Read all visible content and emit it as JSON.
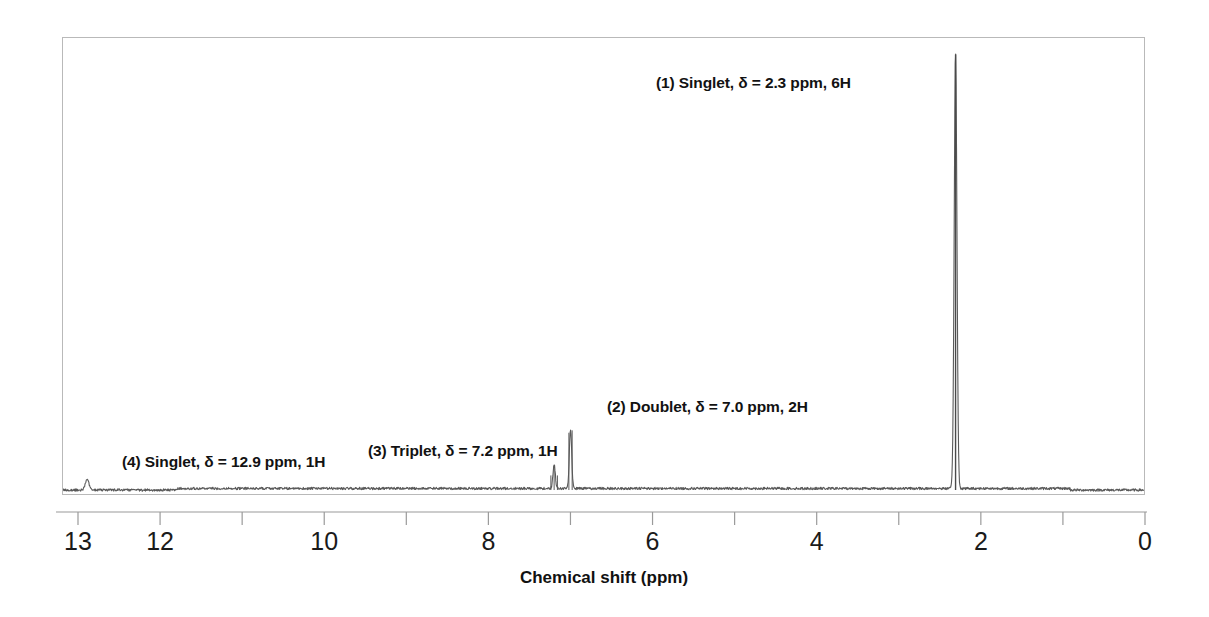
{
  "figure": {
    "title": "",
    "background_color": "#ffffff",
    "frame_color": "#b9b9b9",
    "trace_color": "#5a5a5a"
  },
  "axis": {
    "label": "Chemical shift (ppm)",
    "min_ppm": 0,
    "max_ppm": 13,
    "direction": "right-to-left",
    "tick_labels": [
      "13",
      "12",
      "10",
      "8",
      "6",
      "4",
      "2",
      "0"
    ],
    "tick_values": [
      13,
      12,
      10,
      8,
      6,
      4,
      2,
      0
    ],
    "minor_tick_values": [
      11,
      9,
      7,
      5,
      3,
      1
    ]
  },
  "annotations": [
    {
      "id": 1,
      "text": "(1) Singlet, δ = 2.3 ppm, 6H",
      "x_px": 656,
      "y_px": 74
    },
    {
      "id": 2,
      "text": "(2) Doublet, δ = 7.0 ppm, 2H",
      "x_px": 607,
      "y_px": 398
    },
    {
      "id": 3,
      "text": "(3) Triplet, δ = 7.2 ppm, 1H",
      "x_px": 368,
      "y_px": 442
    },
    {
      "id": 4,
      "text": "(4) Singlet, δ = 12.9 ppm, 1H",
      "x_px": 122,
      "y_px": 453
    }
  ],
  "chart_data": {
    "type": "line",
    "title": "",
    "xlabel": "Chemical shift (ppm)",
    "ylabel": "",
    "xlim": [
      13.4,
      0.0
    ],
    "ylim": [
      0,
      1.0
    ],
    "grid": false,
    "legend": "none",
    "x_axis_reversed": true,
    "peaks": [
      {
        "label": "(1) Singlet, δ = 2.3 ppm, 6H",
        "shift_ppm": 2.3,
        "multiplicity": "singlet",
        "integration": "6H",
        "relative_height": 0.985,
        "width_ppm": 0.035
      },
      {
        "label": "(2) Doublet, δ = 7.0 ppm, 2H",
        "shift_ppm": 7.0,
        "multiplicity": "doublet",
        "integration": "2H",
        "relative_height": 0.135,
        "width_ppm": 0.03
      },
      {
        "label": "(3) Triplet, δ = 7.2 ppm, 1H",
        "shift_ppm": 7.2,
        "multiplicity": "triplet",
        "integration": "1H",
        "relative_height": 0.055,
        "width_ppm": 0.03
      },
      {
        "label": "(4) Singlet, δ = 12.9 ppm, 1H",
        "shift_ppm": 12.9,
        "multiplicity": "singlet",
        "integration": "1H",
        "relative_height": 0.022,
        "width_ppm": 0.05
      }
    ],
    "baseline_noise_level": 0.006
  }
}
